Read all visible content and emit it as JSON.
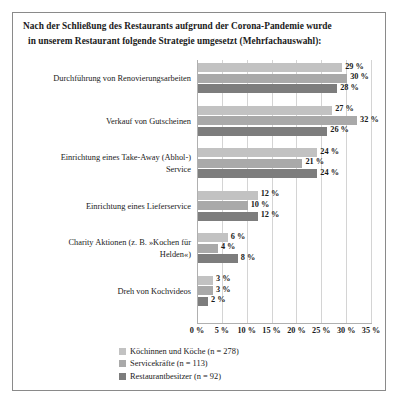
{
  "title_lines": [
    "Nach der Schließung des Restaurants aufgrund der Corona-Pandemie wurde",
    "in unserem Restaurant folgende Strategie umgesetzt (Mehrfachauswahl):"
  ],
  "legend": {
    "items": [
      {
        "label": "Köchinnen und Köche (n = 278)",
        "color": "#c2c2c2"
      },
      {
        "label": "Servicekräfte (n = 113)",
        "color": "#a9a9a9"
      },
      {
        "label": "Restaurantbesitzer (n = 92)",
        "color": "#7d7d7d"
      }
    ]
  },
  "chart_data": {
    "type": "bar",
    "orientation": "horizontal",
    "title": "Nach der Schließung des Restaurants aufgrund der Corona-Pandemie wurde in unserem Restaurant folgende Strategie umgesetzt (Mehrfachauswahl):",
    "xlabel": "",
    "ylabel": "",
    "xlim": [
      0,
      35
    ],
    "xticks": [
      0,
      5,
      10,
      15,
      20,
      25,
      30,
      35
    ],
    "xtick_labels": [
      "0 %",
      "5 %",
      "10 %",
      "15 %",
      "20 %",
      "25 %",
      "30 %",
      "35 %"
    ],
    "grid": true,
    "legend_position": "bottom",
    "categories": [
      "Durchführung von Renovierungsarbeiten",
      "Verkauf von Gutscheinen",
      "Einrichtung eines Take-Away (Abhol-) Service",
      "Einrichtung eines Lieferservice",
      "Charity Aktionen (z. B. »Kochen für Helden«)",
      "Dreh von Kochvideos"
    ],
    "category_lines": [
      [
        "Durchführung von Renovierungsarbeiten"
      ],
      [
        "Verkauf von Gutscheinen"
      ],
      [
        "Einrichtung eines Take-Away (Abhol-)",
        "Service"
      ],
      [
        "Einrichtung eines Lieferservice"
      ],
      [
        "Charity Aktionen (z. B. »Kochen für",
        "Helden«)"
      ],
      [
        "Dreh von Kochvideos"
      ]
    ],
    "series": [
      {
        "name": "Köchinnen und Köche (n = 278)",
        "color": "#c2c2c2",
        "values": [
          29,
          27,
          24,
          12,
          6,
          3
        ],
        "labels": [
          "29 %",
          "27 %",
          "24 %",
          "12 %",
          "6 %",
          "3 %"
        ]
      },
      {
        "name": "Servicekräfte (n = 113)",
        "color": "#a9a9a9",
        "values": [
          30,
          32,
          21,
          10,
          4,
          3
        ],
        "labels": [
          "30 %",
          "32 %",
          "21 %",
          "10 %",
          "4 %",
          "3 %"
        ]
      },
      {
        "name": "Restaurantbesitzer (n = 92)",
        "color": "#7d7d7d",
        "values": [
          28,
          26,
          24,
          12,
          8,
          2
        ],
        "labels": [
          "28 %",
          "26 %",
          "24 %",
          "12 %",
          "8 %",
          "2 %"
        ]
      }
    ]
  }
}
